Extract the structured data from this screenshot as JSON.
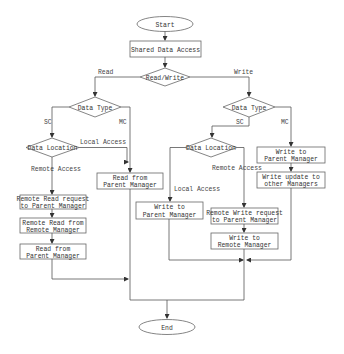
{
  "nodes": {
    "start": "Start",
    "shared": "Shared Data Access",
    "rw": "Read/Write",
    "dt_left": "Data Type",
    "dt_right": "Data Type",
    "dl_left": "Data Location",
    "dl_right": "Data Location",
    "read_parent_mc": [
      "Read from",
      "Parent Manager"
    ],
    "remote_read_req": [
      "Remote Read request",
      "to Parent Manager"
    ],
    "remote_read_remote": [
      "Remote Read from",
      "Remote Manager"
    ],
    "read_parent_sc": [
      "Read from",
      "Parent Manager"
    ],
    "write_parent_mc": [
      "Write to",
      "Parent Manager"
    ],
    "write_update_others": [
      "Write update to",
      "other Managers"
    ],
    "write_parent_local": [
      "Write to",
      "Parent Manager"
    ],
    "remote_write_req": [
      "Remote Write request",
      "to Parent Manager"
    ],
    "write_remote": [
      "Write to",
      "Remote Manager"
    ],
    "end": "End"
  },
  "edges": {
    "read": "Read",
    "write": "Write",
    "sc_left": "SC",
    "mc_left": "MC",
    "sc_right": "SC",
    "mc_right": "MC",
    "local_left": "Local Access",
    "remote_left": "Remote Access",
    "local_right": "Local Access",
    "remote_right": "Remote Access"
  }
}
